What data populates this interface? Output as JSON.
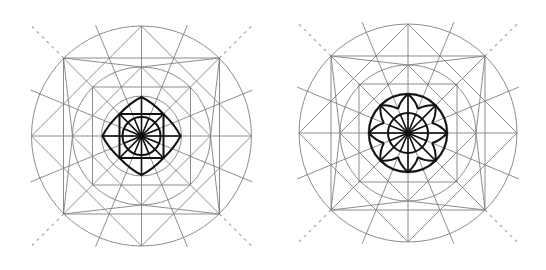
{
  "figure": {
    "width": 546,
    "height": 270,
    "background": "#ffffff",
    "colors": {
      "guide": "#808080",
      "dashed": "#a8a8a8",
      "bold": "#111111"
    },
    "panels": [
      {
        "id": "left",
        "label": "square-star rosette construction",
        "center": [
          141.5,
          136
        ],
        "outer_circle_r": 110,
        "middle_circle_r": 69,
        "inner_guide_circle_r": 40,
        "outer_square_half": 78,
        "inner_square_half": 49,
        "dash_extent": 158,
        "ray_extent": 120,
        "motif": {
          "type": "square-star",
          "square_half": 22,
          "petal_tip_r": 39,
          "hub_circle_r": 19,
          "spokes": 16
        }
      },
      {
        "id": "right",
        "label": "circular rosette construction",
        "center": [
          408,
          133
        ],
        "outer_circle_r": 109,
        "middle_circle_r": 68,
        "inner_guide_circle_r": 40,
        "outer_square_half": 77,
        "inner_square_half": 49,
        "dash_extent": 158,
        "ray_extent": 120,
        "motif": {
          "type": "circle-rosette",
          "ring_r": 39,
          "petal_tip_r": 39,
          "hub_circle_r": 20,
          "spokes": 16
        }
      }
    ]
  }
}
